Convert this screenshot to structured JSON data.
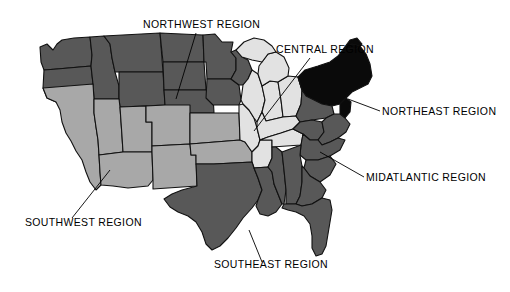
{
  "figure": {
    "background_color": "#ffffff",
    "outline_color": "#111111"
  },
  "palette": {
    "northwest_fill": "#585858",
    "southwest_fill": "#a8a8a8",
    "central_fill": "#e2e2e2",
    "northeast_fill": "#0a0a0a",
    "midatlantic_fill": "#585858",
    "southeast_fill": "#585858",
    "label_color": "#000000",
    "leader_color": "#000000"
  },
  "regions": [
    {
      "id": "northwest",
      "label": "NORTHWEST REGION",
      "shade": "dark-gray",
      "fill": "#585858",
      "label_x": 143,
      "label_y": 28,
      "leader": {
        "x1": 196,
        "y1": 33,
        "x2": 176,
        "y2": 99
      }
    },
    {
      "id": "central",
      "label": "CENTRAL REGION",
      "shade": "light-gray",
      "fill": "#e2e2e2",
      "label_x": 276,
      "label_y": 53,
      "leader": {
        "x1": 310,
        "y1": 58,
        "x2": 254,
        "y2": 131
      }
    },
    {
      "id": "northeast",
      "label": "NORTHEAST REGION",
      "shade": "black",
      "fill": "#0a0a0a",
      "label_x": 382,
      "label_y": 115,
      "leader": {
        "x1": 380,
        "y1": 111,
        "x2": 348,
        "y2": 99
      }
    },
    {
      "id": "midatlantic",
      "label": "MIDATLANTIC REGION",
      "shade": "dark-gray",
      "fill": "#585858",
      "label_x": 366,
      "label_y": 181,
      "leader": {
        "x1": 364,
        "y1": 177,
        "x2": 320,
        "y2": 152
      }
    },
    {
      "id": "southwest",
      "label": "SOUTHWEST REGION",
      "shade": "medium-gray",
      "fill": "#a8a8a8",
      "label_x": 25,
      "label_y": 226,
      "leader": {
        "x1": 72,
        "y1": 218,
        "x2": 110,
        "y2": 170
      }
    },
    {
      "id": "southeast",
      "label": "SOUTHEAST REGION",
      "shade": "dark-gray",
      "fill": "#585858",
      "label_x": 214,
      "label_y": 268,
      "leader": {
        "x1": 262,
        "y1": 262,
        "x2": 249,
        "y2": 230
      }
    }
  ],
  "region_membership": {
    "northwest": [
      "Washington",
      "Oregon",
      "Idaho",
      "Montana",
      "Wyoming",
      "North Dakota",
      "South Dakota",
      "Nebraska",
      "Minnesota",
      "Iowa",
      "Wisconsin"
    ],
    "southwest": [
      "California",
      "Nevada",
      "Utah",
      "Arizona",
      "New Mexico",
      "Colorado",
      "Kansas",
      "Oklahoma"
    ],
    "central": [
      "Michigan",
      "Illinois",
      "Indiana",
      "Ohio",
      "Missouri",
      "Arkansas",
      "Kentucky",
      "Tennessee"
    ],
    "northeast": [
      "New York",
      "Vermont",
      "New Hampshire",
      "Maine",
      "Massachusetts",
      "Connecticut",
      "Rhode Island",
      "New Jersey"
    ],
    "midatlantic": [
      "Pennsylvania",
      "West Virginia",
      "Virginia",
      "Maryland",
      "Delaware",
      "North Carolina",
      "South Carolina"
    ],
    "southeast": [
      "Texas",
      "Louisiana",
      "Mississippi",
      "Alabama",
      "Georgia",
      "Florida"
    ]
  }
}
